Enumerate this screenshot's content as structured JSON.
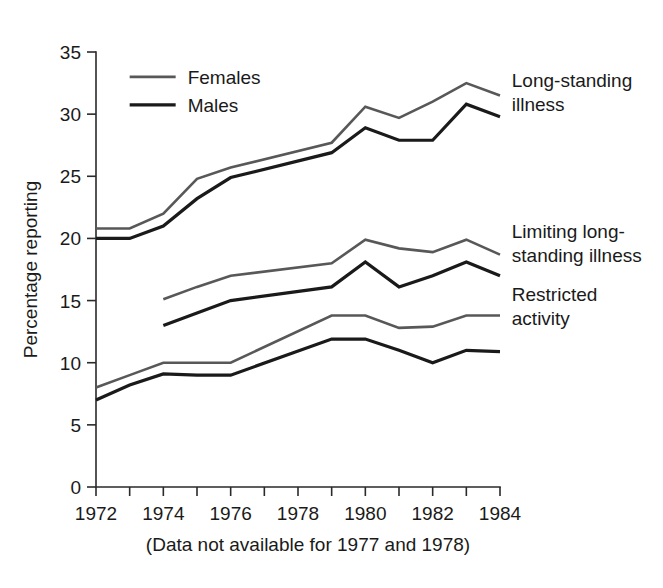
{
  "chart_data": {
    "type": "line",
    "title": "",
    "xlabel": "",
    "ylabel": "Percentage reporting",
    "note": "(Data not available for 1977 and 1978)",
    "xlim": [
      1972,
      1984
    ],
    "ylim": [
      0,
      35
    ],
    "yticks": [
      0,
      5,
      10,
      15,
      20,
      25,
      30,
      35
    ],
    "ytick_labels": [
      "0",
      "5",
      "10",
      "15",
      "20",
      "25",
      "30",
      "35"
    ],
    "xticks": [
      1972,
      1973,
      1974,
      1975,
      1976,
      1977,
      1978,
      1979,
      1980,
      1981,
      1982,
      1983,
      1984
    ],
    "xtick_labels": [
      "1972",
      "",
      "1974",
      "",
      "1976",
      "",
      "1978",
      "",
      "1980",
      "",
      "1982",
      "",
      "1984"
    ],
    "grid": false,
    "legend_position": "upper-left",
    "colors": {
      "females": "#585858",
      "males": "#1a1a1a",
      "axis": "#2a2a2a"
    },
    "legend": [
      {
        "name": "Females",
        "color_key": "females"
      },
      {
        "name": "Males",
        "color_key": "males"
      }
    ],
    "groups": [
      {
        "label_lines": [
          "Long-standing",
          "illness"
        ],
        "label_name": "long-standing-illness",
        "series": [
          {
            "name": "Females",
            "color_key": "females",
            "x": [
              1972,
              1973,
              1974,
              1975,
              1976,
              1979,
              1980,
              1981,
              1982,
              1983,
              1984
            ],
            "y": [
              20.8,
              20.8,
              22.0,
              24.8,
              25.7,
              27.7,
              30.6,
              29.7,
              31.0,
              32.5,
              31.5
            ]
          },
          {
            "name": "Males",
            "color_key": "males",
            "x": [
              1972,
              1973,
              1974,
              1975,
              1976,
              1979,
              1980,
              1981,
              1982,
              1983,
              1984
            ],
            "y": [
              20.0,
              20.0,
              21.0,
              23.2,
              24.9,
              26.9,
              28.9,
              27.9,
              27.9,
              30.8,
              29.8
            ]
          }
        ]
      },
      {
        "label_lines": [
          "Limiting long-",
          "standing illness"
        ],
        "label_name": "limiting-long-standing-illness",
        "series": [
          {
            "name": "Females",
            "color_key": "females",
            "x": [
              1974,
              1975,
              1976,
              1979,
              1980,
              1981,
              1982,
              1983,
              1984
            ],
            "y": [
              15.1,
              16.1,
              17.0,
              18.0,
              19.9,
              19.2,
              18.9,
              19.9,
              18.7
            ]
          },
          {
            "name": "Males",
            "color_key": "males",
            "x": [
              1974,
              1975,
              1976,
              1979,
              1980,
              1981,
              1982,
              1983,
              1984
            ],
            "y": [
              13.0,
              14.0,
              15.0,
              16.1,
              18.1,
              16.1,
              17.0,
              18.1,
              17.0
            ]
          }
        ]
      },
      {
        "label_lines": [
          "Restricted",
          "activity"
        ],
        "label_name": "restricted-activity",
        "series": [
          {
            "name": "Females",
            "color_key": "females",
            "x": [
              1972,
              1973,
              1974,
              1975,
              1976,
              1979,
              1980,
              1981,
              1982,
              1983,
              1984
            ],
            "y": [
              8.0,
              9.0,
              10.0,
              10.0,
              10.0,
              13.8,
              13.8,
              12.8,
              12.9,
              13.8,
              13.8
            ]
          },
          {
            "name": "Males",
            "color_key": "males",
            "x": [
              1972,
              1973,
              1974,
              1975,
              1976,
              1979,
              1980,
              1981,
              1982,
              1983,
              1984
            ],
            "y": [
              7.0,
              8.2,
              9.1,
              9.0,
              9.0,
              11.9,
              11.9,
              11.0,
              10.0,
              11.0,
              10.9
            ]
          }
        ]
      }
    ],
    "series_label_positions": [
      {
        "x": 1984.35,
        "y": 32.2
      },
      {
        "x": 1984.35,
        "y": 20.0
      },
      {
        "x": 1984.35,
        "y": 15.0
      }
    ],
    "legend_anchor": {
      "x": 1973.0,
      "y": 33.0
    }
  }
}
